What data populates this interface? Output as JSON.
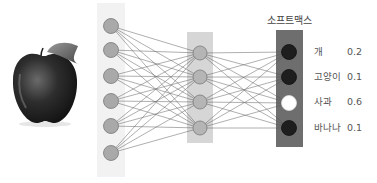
{
  "diagram": {
    "type": "neural-network-softmax",
    "input_image": {
      "subject": "apple",
      "icon": "apple-icon"
    },
    "layers": [
      {
        "name": "input",
        "node_count": 6,
        "background": "#f2f2f2",
        "node_fill": "#a9a9a9"
      },
      {
        "name": "hidden",
        "node_count": 4,
        "background": "#d6d6d6",
        "node_fill": "#b5b5b5"
      },
      {
        "name": "output",
        "node_count": 4,
        "background": "#6e6e6e",
        "label": "소프트맥스"
      }
    ],
    "connections": "fully-connected",
    "outputs": [
      {
        "label": "개",
        "value": "0.2",
        "node_fill": "#1e1e1e"
      },
      {
        "label": "고양이",
        "value": "0.1",
        "node_fill": "#1e1e1e"
      },
      {
        "label": "사과",
        "value": "0.6",
        "node_fill": "#ffffff"
      },
      {
        "label": "바나나",
        "value": "0.1",
        "node_fill": "#1e1e1e"
      }
    ]
  }
}
